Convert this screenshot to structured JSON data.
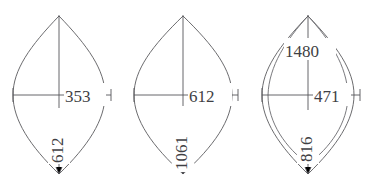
{
  "drawing": {
    "title": "Three vesica (lens) shapes with dimension callouts",
    "background_color": "#ffffff",
    "line_color": "#5a5a5e",
    "text_color": "#3f3f44",
    "figures": [
      {
        "id": "figure-1",
        "name": "lens-left",
        "inner_arc": false,
        "dimensions": {
          "horizontal": "353",
          "vertical": "612",
          "arc": ""
        }
      },
      {
        "id": "figure-2",
        "name": "lens-middle",
        "inner_arc": false,
        "dimensions": {
          "horizontal": "612",
          "vertical": "1061",
          "arc": ""
        }
      },
      {
        "id": "figure-3",
        "name": "lens-right",
        "inner_arc": true,
        "dimensions": {
          "horizontal": "471",
          "vertical": "816",
          "arc": "1480"
        }
      }
    ]
  }
}
